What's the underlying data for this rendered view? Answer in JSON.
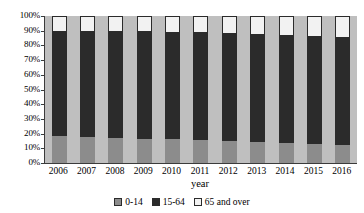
{
  "chart_data": {
    "type": "bar",
    "stacked": true,
    "stack_mode": "percent",
    "title": "",
    "xlabel": "year",
    "ylabel": "",
    "ylim": [
      0,
      100
    ],
    "grid": false,
    "legend_position": "bottom",
    "categories": [
      "2006",
      "2007",
      "2008",
      "2009",
      "2010",
      "2011",
      "2012",
      "2013",
      "2014",
      "2015",
      "2016"
    ],
    "ytick_labels": [
      "100%",
      "90%",
      "80%",
      "70%",
      "60%",
      "50%",
      "40%",
      "30%",
      "20%",
      "10%",
      "0%"
    ],
    "ytick_values": [
      100,
      90,
      80,
      70,
      60,
      50,
      40,
      30,
      20,
      10,
      0
    ],
    "series": [
      {
        "name": "0-14",
        "color": "#8c8c8c",
        "values": [
          18.5,
          17.5,
          17.0,
          16.5,
          16.0,
          15.5,
          15.0,
          14.5,
          13.5,
          13.0,
          12.5
        ]
      },
      {
        "name": "15-64",
        "color": "#2b2b2b",
        "values": [
          71.5,
          72.0,
          72.5,
          73.0,
          73.0,
          73.5,
          73.5,
          73.0,
          73.5,
          73.5,
          73.5
        ]
      },
      {
        "name": "65 and over",
        "color": "#f2f2f2",
        "values": [
          10.0,
          10.5,
          10.5,
          10.5,
          11.0,
          11.0,
          11.5,
          12.5,
          13.0,
          13.5,
          14.0
        ]
      }
    ]
  },
  "legend": {
    "items": [
      {
        "label": "0-14",
        "swatch": "#8c8c8c"
      },
      {
        "label": "15-64",
        "swatch": "#2b2b2b"
      },
      {
        "label": "65 and over",
        "swatch": "#f2f2f2"
      }
    ]
  },
  "axis": {
    "x_title": "year"
  },
  "colors": {
    "plot_background": "#bfbfbf",
    "axis_line": "#3b3b3b",
    "young": "#8c8c8c",
    "adult": "#2b2b2b",
    "old": "#f2f2f2"
  }
}
